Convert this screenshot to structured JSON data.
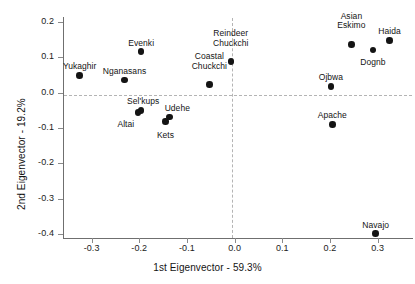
{
  "chart_data": {
    "type": "scatter",
    "title": "",
    "xlabel": "1st Eigenvector - 59.3%",
    "ylabel": "2nd Eigenvector - 19.2%",
    "xlim": [
      -0.36,
      0.37
    ],
    "ylim": [
      -0.41,
      0.21
    ],
    "xticks": [
      -0.3,
      -0.2,
      -0.1,
      0.0,
      0.1,
      0.2,
      0.3
    ],
    "xtick_labels": [
      "-0.3",
      "-0.2",
      "-0.1",
      "0.0",
      "0.1",
      "0.2",
      "0.3"
    ],
    "yticks": [
      0.2,
      0.1,
      0.0,
      -0.1,
      -0.2,
      -0.3,
      -0.4
    ],
    "ytick_labels": [
      "0.2",
      "0.1",
      "0.0",
      "-0.1",
      "-0.2",
      "-0.3",
      "-0.4"
    ],
    "grid": false,
    "legend": "none",
    "reference_lines": [
      {
        "axis": "horizontal",
        "value": 0.0,
        "style": "dashed"
      },
      {
        "axis": "vertical",
        "value": 0.0,
        "style": "dashed"
      }
    ],
    "marker": {
      "shape": "circle",
      "color": "#141414",
      "size": 6.5
    },
    "points": [
      {
        "label": "Yukaghir",
        "x": -0.325,
        "y": 0.048,
        "label_dx": 0,
        "label_dy": -13
      },
      {
        "label": "Nganasans",
        "x": -0.231,
        "y": 0.035,
        "label_dx": 0,
        "label_dy": -13
      },
      {
        "label": "Evenki",
        "x": -0.196,
        "y": 0.115,
        "label_dx": 0,
        "label_dy": -13
      },
      {
        "label": "Coastal\nChuckchi",
        "x": -0.053,
        "y": 0.022,
        "label_dx": 0,
        "label_dy": -23
      },
      {
        "label": "Reindeer\nChuckchi",
        "x": -0.008,
        "y": 0.087,
        "label_dx": 0,
        "label_dy": -23
      },
      {
        "label": "Asian\nEskimo",
        "x": 0.245,
        "y": 0.136,
        "label_dx": 0,
        "label_dy": -23
      },
      {
        "label": "Haida",
        "x": 0.325,
        "y": 0.147,
        "label_dx": 0,
        "label_dy": -13
      },
      {
        "label": "Dognb",
        "x": 0.29,
        "y": 0.12,
        "label_dx": 0,
        "label_dy": 12
      },
      {
        "label": "Ojbwa",
        "x": 0.202,
        "y": 0.017,
        "label_dx": 0,
        "label_dy": -13
      },
      {
        "label": "Sel'kups",
        "x": -0.196,
        "y": -0.05,
        "label_dx": 2,
        "label_dy": -13
      },
      {
        "label": "Altai",
        "x": -0.203,
        "y": -0.056,
        "label_dx": -12,
        "label_dy": 12
      },
      {
        "label": "Udehe",
        "x": -0.137,
        "y": -0.069,
        "label_dx": 8,
        "label_dy": -13
      },
      {
        "label": "Kets",
        "x": -0.145,
        "y": -0.081,
        "label_dx": 0,
        "label_dy": 14
      },
      {
        "label": "Apache",
        "x": 0.205,
        "y": -0.09,
        "label_dx": 0,
        "label_dy": -13
      },
      {
        "label": "Navajo",
        "x": 0.296,
        "y": -0.398,
        "label_dx": 0,
        "label_dy": -13
      }
    ]
  }
}
